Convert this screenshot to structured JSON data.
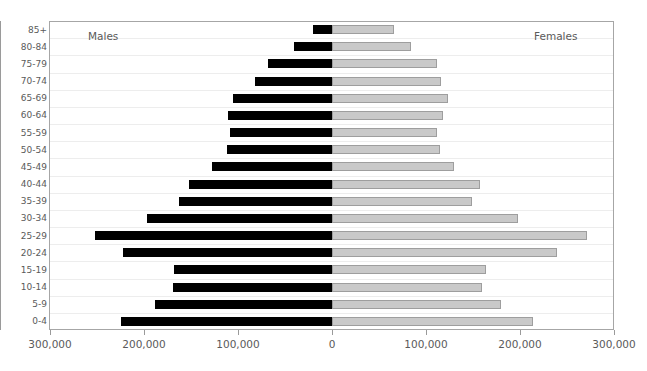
{
  "chart_data": {
    "type": "bar",
    "subtype": "population-pyramid",
    "title": "",
    "xlabel": "",
    "ylabel": "",
    "grid": true,
    "legend_position": "inside-top-corners",
    "categories": [
      "85+",
      "80-84",
      "75-79",
      "70-74",
      "65-69",
      "60-64",
      "55-59",
      "50-54",
      "45-49",
      "40-44",
      "35-39",
      "30-34",
      "25-29",
      "20-24",
      "15-19",
      "10-14",
      "5-9",
      "0-4"
    ],
    "axis": {
      "tick_labels": [
        "300,000",
        "200,000",
        "100,000",
        "0",
        "100,000",
        "200,000",
        "300,000"
      ],
      "tick_values": [
        -300000,
        -200000,
        -100000,
        0,
        100000,
        200000,
        300000
      ],
      "xlim": [
        -300000,
        300000
      ],
      "origin_label": "0"
    },
    "series": [
      {
        "name": "Males",
        "color": "#000000",
        "side": "left",
        "values": [
          20000,
          40000,
          68000,
          82000,
          105000,
          111000,
          109000,
          112000,
          128000,
          152000,
          163000,
          197000,
          252000,
          222000,
          168000,
          169000,
          188000,
          224000
        ]
      },
      {
        "name": "Females",
        "color": "#c9c9c9",
        "side": "right",
        "values": [
          66000,
          84000,
          112000,
          116000,
          123000,
          118000,
          112000,
          115000,
          130000,
          157000,
          149000,
          198000,
          271000,
          239000,
          164000,
          160000,
          180000,
          214000
        ]
      }
    ],
    "captions": {
      "left": "Males",
      "right": "Females"
    }
  },
  "colors": {
    "male_bar": "#000000",
    "female_bar": "#c9c9c9",
    "female_bar_border": "#9e9e9e",
    "frame": "#a6a6a6",
    "gridline": "#ededed",
    "text": "#5a5a5a",
    "background": "#ffffff"
  }
}
